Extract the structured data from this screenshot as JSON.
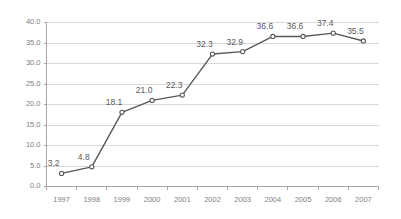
{
  "chart_data": {
    "type": "line",
    "title": "",
    "subtitle": "",
    "xlabel": "",
    "ylabel": "",
    "categories": [
      "1997",
      "1998",
      "1999",
      "2000",
      "2001",
      "2002",
      "2003",
      "2004",
      "2005",
      "2006",
      "2007"
    ],
    "values": [
      3.2,
      4.8,
      18.1,
      21.0,
      22.3,
      32.3,
      32.9,
      36.6,
      36.6,
      37.4,
      35.5
    ],
    "point_labels": [
      "3.2",
      "4.8",
      "18.1",
      "21.0",
      "22.3",
      "32.3",
      "32.9",
      "36.6",
      "36.6",
      "37.4",
      "35.5"
    ],
    "ylim": [
      0.0,
      40.0
    ],
    "ytick_values": [
      0.0,
      5.0,
      10.0,
      15.0,
      20.0,
      25.0,
      30.0,
      35.0,
      40.0
    ],
    "ytick_labels": [
      "0.0",
      "5.0",
      "10.0",
      "15.0",
      "20.0",
      "25.0",
      "30.0",
      "35.0",
      "40.0"
    ],
    "grid": true,
    "legend": false,
    "legend_position": "none",
    "series": [
      {
        "name": "",
        "values": [
          3.2,
          4.8,
          18.1,
          21.0,
          22.3,
          32.3,
          32.9,
          36.6,
          36.6,
          37.4,
          35.5
        ]
      }
    ],
    "colors": {
      "line": "#595959",
      "marker_fill": "#ffffff",
      "marker_stroke": "#595959",
      "grid": "#d9d9d9",
      "axis": "#a6a6a6",
      "tick_text": "#808080",
      "label_text": "#595959",
      "background": "#ffffff"
    }
  }
}
